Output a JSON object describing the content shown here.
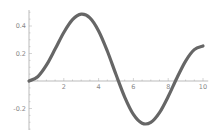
{
  "chart_data": {
    "type": "line",
    "title": "",
    "xlabel": "",
    "ylabel": "",
    "xlim": [
      0,
      10
    ],
    "ylim": [
      -0.35,
      0.5
    ],
    "grid": false,
    "legend": null,
    "x_ticks": [
      2,
      4,
      6,
      8,
      10
    ],
    "x_tick_labels": [
      "2",
      "4",
      "6",
      "8",
      "10"
    ],
    "y_ticks": [
      -0.2,
      0.2,
      0.4
    ],
    "y_tick_labels": [
      "-0.2",
      "0.2",
      "0.4"
    ],
    "series": [
      {
        "name": "curve",
        "color": "#666666",
        "x": [
          0,
          0.5,
          1,
          1.5,
          2,
          2.5,
          3,
          3.5,
          4,
          4.5,
          5,
          5.5,
          6,
          6.5,
          7,
          7.5,
          8,
          8.5,
          9,
          9.5,
          10
        ],
        "values": [
          0.0,
          0.031,
          0.115,
          0.232,
          0.353,
          0.446,
          0.486,
          0.459,
          0.364,
          0.218,
          0.047,
          -0.117,
          -0.243,
          -0.307,
          -0.301,
          -0.23,
          -0.113,
          0.022,
          0.145,
          0.228,
          0.255
        ]
      }
    ]
  },
  "colors": {
    "axis": "#aaaaaa",
    "tick_label": "#888888",
    "line": "#666666",
    "background": "#ffffff"
  }
}
